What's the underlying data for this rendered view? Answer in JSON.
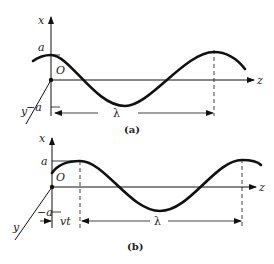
{
  "figure": {
    "panels": [
      {
        "caption": "(a)",
        "axis_labels": {
          "vertical": "x",
          "horizontal": "z",
          "depth": "y",
          "origin": "O"
        },
        "amplitude_labels": {
          "positive": "a",
          "negative": "−a"
        },
        "dimension_labels": {
          "wavelength": "λ"
        }
      },
      {
        "caption": "(b)",
        "axis_labels": {
          "vertical": "x",
          "horizontal": "z",
          "depth": "y",
          "origin": "O"
        },
        "amplitude_labels": {
          "positive": "a",
          "negative": "−a"
        },
        "dimension_labels": {
          "wavelength": "λ",
          "shift": "vt"
        }
      }
    ],
    "colors": {
      "stroke": "#111111",
      "background": "#ffffff"
    }
  }
}
